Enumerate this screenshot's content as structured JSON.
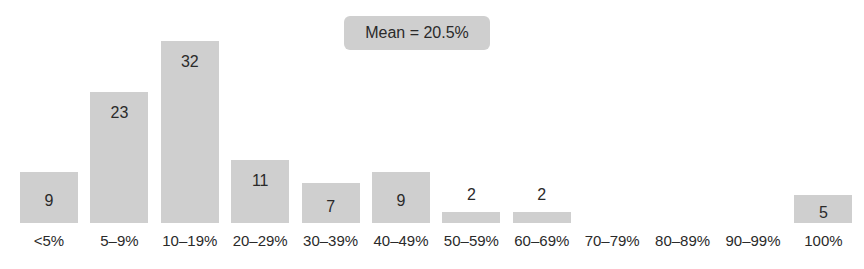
{
  "chart_data": {
    "type": "bar",
    "title": "",
    "xlabel": "",
    "ylabel": "",
    "categories": [
      "<5%",
      "5–9%",
      "10–19%",
      "20–29%",
      "30–39%",
      "40–49%",
      "50–59%",
      "60–69%",
      "70–79%",
      "80–89%",
      "90–99%",
      "100%"
    ],
    "values": [
      9,
      23,
      32,
      11,
      7,
      9,
      2,
      2,
      0,
      0,
      0,
      5
    ],
    "value_labels": [
      "9",
      "23",
      "32",
      "11",
      "7",
      "9",
      "2",
      "2",
      "",
      "",
      "",
      "5"
    ],
    "ylim": [
      0,
      33
    ],
    "grid": false,
    "legend": null,
    "annotations": [
      {
        "text": "Mean = 20.5%"
      }
    ],
    "bar_color": "#cfcfcf"
  },
  "annotation": {
    "mean_label": "Mean = 20.5%"
  }
}
